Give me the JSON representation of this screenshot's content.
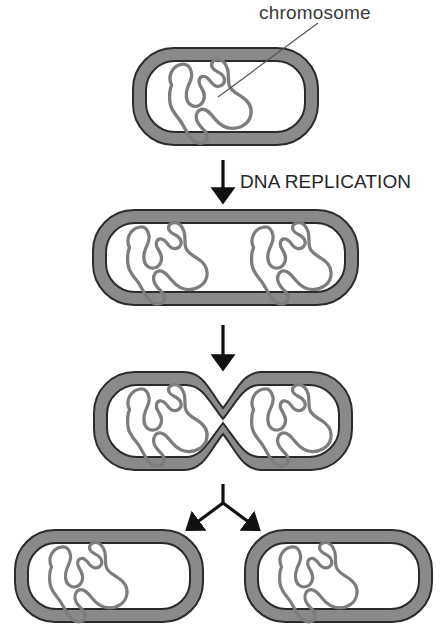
{
  "figure": {
    "background_color": "#ffffff",
    "wall_fill_color": "#8a8a8a",
    "wall_edge_color": "#2b2b2b",
    "cytoplasm_color": "#ffffff",
    "chromosome_color": "#7d7d7d",
    "arrow_color": "#111111",
    "leader_line_color": "#555555",
    "text_color": "#3a3a3a"
  },
  "labels": {
    "chromosome": "chromosome",
    "dna_replication": "DNA REPLICATION"
  },
  "stages": [
    {
      "name": "parent-cell",
      "order": 1,
      "chromosome_count": 1,
      "constricted": false,
      "description": "single parent cell with one chromosome"
    },
    {
      "name": "replicated-cell",
      "order": 2,
      "chromosome_count": 2,
      "constricted": false,
      "description": "elongated cell with two chromosomes after DNA replication"
    },
    {
      "name": "constricting-cell",
      "order": 3,
      "chromosome_count": 2,
      "constricted": true,
      "description": "cell constricting at midpoint forming septum"
    },
    {
      "name": "daughter-cell-left",
      "order": 4,
      "chromosome_count": 1,
      "constricted": false,
      "description": "left daughter cell"
    },
    {
      "name": "daughter-cell-right",
      "order": 4,
      "chromosome_count": 1,
      "constricted": false,
      "description": "right daughter cell"
    }
  ],
  "arrows": [
    {
      "name": "arrow-replication",
      "type": "straight-down",
      "label": "DNA REPLICATION"
    },
    {
      "name": "arrow-constriction",
      "type": "straight-down",
      "label": ""
    },
    {
      "name": "arrow-division",
      "type": "branching-y",
      "label": ""
    }
  ]
}
